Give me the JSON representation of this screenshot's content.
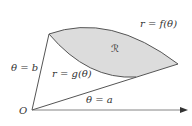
{
  "diagram": {
    "region_label": "ℛ",
    "outer_curve_label": "r = f(θ)",
    "inner_curve_label": "r = g(θ)",
    "upper_ray_label": "θ = b",
    "lower_ray_label": "θ = a",
    "origin_label": "O",
    "colors": {
      "region_fill": "#dcdcdc",
      "stroke": "#555555",
      "axis": "#444444",
      "text": "#333333"
    }
  }
}
